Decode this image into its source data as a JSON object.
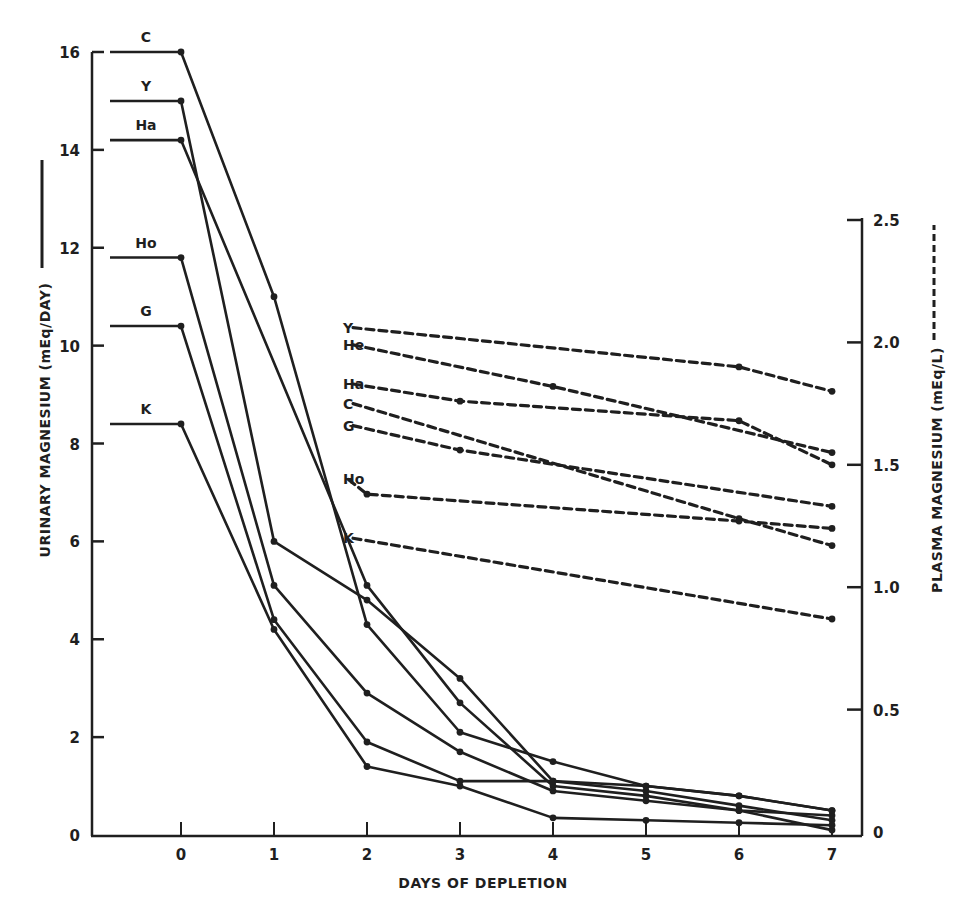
{
  "chart_data": {
    "type": "line",
    "title": "",
    "xlabel": "DAYS OF DEPLETION",
    "ylabel": "URINARY MAGNESIUM (mEq/DAY)",
    "ylabel_right": "PLASMA MAGNESIUM (mEq/L)",
    "x_ticks": [
      "0",
      "1",
      "2",
      "3",
      "4",
      "5",
      "6",
      "7"
    ],
    "y_ticks": [
      "0",
      "2",
      "4",
      "6",
      "8",
      "10",
      "12",
      "14",
      "16"
    ],
    "y_right_ticks": [
      "0",
      "0.5",
      "1.0",
      "1.5",
      "2.0",
      "2.5"
    ],
    "xlim": [
      -0.95,
      7.3
    ],
    "ylim": [
      0,
      16
    ],
    "ylim_right": [
      0,
      2.5
    ],
    "grid": false,
    "legend": "inline labels; solid line = urinary magnesium (left axis), dashed line = plasma magnesium (right axis)",
    "urinary_series": [
      {
        "name": "C",
        "baseline": 16.0,
        "x": [
          0,
          1,
          2,
          3,
          4,
          5,
          6,
          7
        ],
        "values": [
          16.0,
          11.0,
          4.3,
          2.1,
          1.5,
          1.0,
          0.8,
          0.5
        ]
      },
      {
        "name": "Y",
        "baseline": 15.0,
        "x": [
          0,
          1,
          2,
          3,
          4,
          5,
          6,
          7
        ],
        "values": [
          15.0,
          6.0,
          4.8,
          3.2,
          1.1,
          0.9,
          0.6,
          0.3
        ]
      },
      {
        "name": "Ha",
        "baseline": 14.2,
        "x": [
          0,
          2,
          3,
          4,
          5,
          6,
          7
        ],
        "values": [
          14.2,
          5.1,
          2.7,
          1.0,
          0.8,
          0.5,
          0.1
        ]
      },
      {
        "name": "Ho",
        "baseline": 11.8,
        "x": [
          0,
          1,
          2,
          3,
          4,
          5,
          6,
          7
        ],
        "values": [
          11.8,
          5.1,
          2.9,
          1.7,
          0.9,
          0.7,
          0.5,
          0.4
        ]
      },
      {
        "name": "G",
        "baseline": 10.4,
        "x": [
          0,
          1,
          2,
          3,
          4,
          5,
          6,
          7
        ],
        "values": [
          10.4,
          4.4,
          1.9,
          1.1,
          1.1,
          1.0,
          0.8,
          0.5
        ]
      },
      {
        "name": "K",
        "baseline": 8.4,
        "x": [
          0,
          1,
          2,
          3,
          4,
          5,
          6,
          7
        ],
        "values": [
          8.4,
          4.2,
          1.4,
          1.0,
          0.35,
          0.3,
          0.25,
          0.2
        ]
      }
    ],
    "plasma_series": [
      {
        "name": "Y",
        "x": [
          1.85,
          6,
          7
        ],
        "values": [
          2.06,
          1.9,
          1.8
        ]
      },
      {
        "name": "He",
        "x": [
          1.85,
          4,
          7
        ],
        "values": [
          1.99,
          1.82,
          1.55
        ]
      },
      {
        "name": "Ha",
        "x": [
          1.85,
          3,
          6,
          7
        ],
        "values": [
          1.83,
          1.76,
          1.68,
          1.5
        ]
      },
      {
        "name": "C",
        "x": [
          1.85,
          6,
          7
        ],
        "values": [
          1.75,
          1.28,
          1.17
        ]
      },
      {
        "name": "G",
        "x": [
          1.85,
          3,
          7
        ],
        "values": [
          1.66,
          1.56,
          1.33
        ]
      },
      {
        "name": "Ho",
        "x": [
          1.8,
          2,
          6,
          7
        ],
        "values": [
          1.44,
          1.38,
          1.27,
          1.24
        ]
      },
      {
        "name": "K",
        "x": [
          1.85,
          7
        ],
        "values": [
          1.2,
          0.87
        ]
      }
    ]
  }
}
